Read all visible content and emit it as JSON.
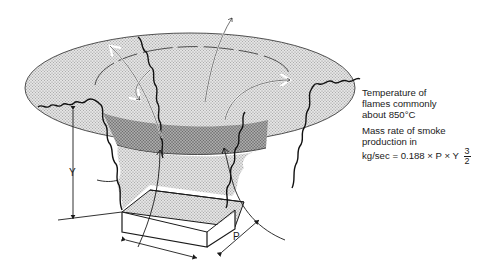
{
  "diagram": {
    "colors": {
      "smoke_layer_fill": "#d6d6d6",
      "plume_band_fill": "#9e9e9e",
      "fire_base_top_fill": "#cfcfcf",
      "fire_base_side_fill": "#ffffff",
      "line_color": "#1a1a1a"
    },
    "labels": {
      "height_dimension": "Y",
      "perimeter_dimension": "P"
    },
    "annotations": {
      "temperature": {
        "line1": "Temperature of",
        "line2": "flames commonly",
        "line3": "about 850°C"
      },
      "mass_rate": {
        "line1": "Mass rate of smoke",
        "line2": "production in",
        "line3_prefix": "kg/sec = 0.188 × P × Y",
        "exponent_numerator": "3",
        "exponent_denominator": "2"
      }
    }
  }
}
